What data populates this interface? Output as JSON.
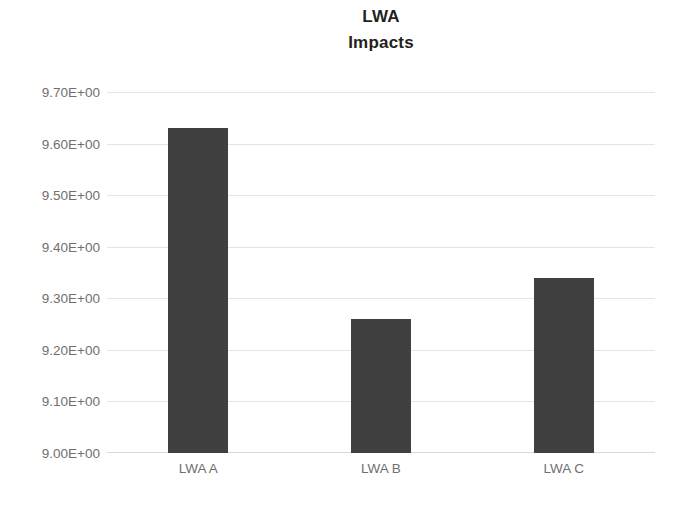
{
  "chart_data": {
    "type": "bar",
    "title": "LWA Impacts",
    "title_lines": [
      "LWA",
      "Impacts"
    ],
    "categories": [
      "LWA A",
      "LWA B",
      "LWA C"
    ],
    "values": [
      9.63,
      9.26,
      9.34
    ],
    "xlabel": "",
    "ylabel": "",
    "ylim": [
      9.0,
      9.7
    ],
    "ytick_step": 0.1,
    "ytick_labels": [
      "9.70E+00",
      "9.60E+00",
      "9.50E+00",
      "9.40E+00",
      "9.30E+00",
      "9.20E+00",
      "9.10E+00",
      "9.00E+00"
    ],
    "ytick_values": [
      9.7,
      9.6,
      9.5,
      9.4,
      9.3,
      9.2,
      9.1,
      9.0
    ],
    "grid": true,
    "grid_axis": "y",
    "legend": false,
    "legend_position": "none",
    "series": [
      {
        "name": "Impacts",
        "values": [
          9.63,
          9.26,
          9.34
        ]
      }
    ],
    "colors": {
      "bar": "#404040",
      "gridline": "#e4e4e4",
      "axis_text": "#6f6f6f",
      "title_text": "#231f20",
      "background": "#ffffff"
    }
  }
}
